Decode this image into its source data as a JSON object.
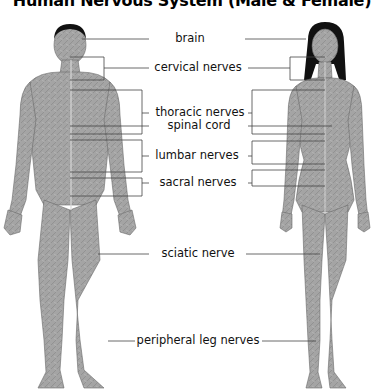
{
  "title": "Human Nervous System (Male & Female)",
  "figures": {
    "left": "male",
    "right": "female"
  },
  "labels": [
    {
      "id": "brain",
      "text": "brain",
      "x": 190,
      "y": 34
    },
    {
      "id": "cervical-nerves",
      "text": "cervical nerves",
      "x": 196,
      "y": 62
    },
    {
      "id": "thoracic-nerves",
      "text": "thoracic nerves",
      "x": 201,
      "y": 107
    },
    {
      "id": "spinal-cord",
      "text": "spinal cord",
      "x": 198,
      "y": 119
    },
    {
      "id": "lumbar-nerves",
      "text": "lumbar nerves",
      "x": 197,
      "y": 150
    },
    {
      "id": "sacral-nerves",
      "text": "sacral nerves",
      "x": 198,
      "y": 176
    },
    {
      "id": "sciatic-nerve",
      "text": "sciatic nerve",
      "x": 198,
      "y": 247
    },
    {
      "id": "peripheral-leg-nerves",
      "text": "peripheral leg nerves",
      "x": 198,
      "y": 333
    }
  ],
  "colors": {
    "skin": "#a7a7a7",
    "skin_dark": "#7d7d7d",
    "hair": "#111111",
    "line": "#555555",
    "text": "#111111"
  }
}
